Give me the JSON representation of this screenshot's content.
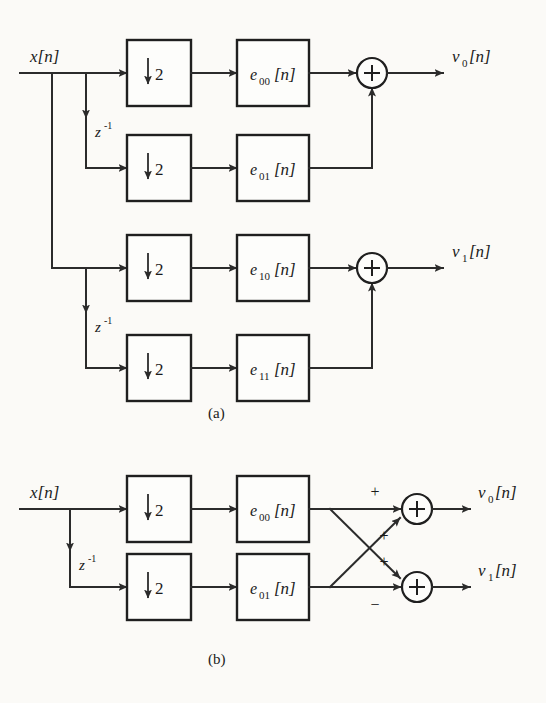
{
  "figure": {
    "background_color": "#fbfaf7",
    "ink_color": "#1f1f1f"
  },
  "panels": [
    {
      "id": "a",
      "caption": "(a)",
      "input_label": "x[n]",
      "delay_labels": [
        "z",
        "z"
      ],
      "delay_exponent": "-1",
      "branches": [
        {
          "downsampler": {
            "arrow": "↓",
            "factor": "2"
          },
          "filter_base": "e",
          "filter_sub": "00",
          "filter_bracket": "[n]",
          "adder_symbol": "+"
        },
        {
          "downsampler": {
            "arrow": "↓",
            "factor": "2"
          },
          "filter_base": "e",
          "filter_sub": "01",
          "filter_bracket": "[n]",
          "adder_symbol": "+"
        },
        {
          "downsampler": {
            "arrow": "↓",
            "factor": "2"
          },
          "filter_base": "e",
          "filter_sub": "10",
          "filter_bracket": "[n]",
          "adder_symbol": "+"
        },
        {
          "downsampler": {
            "arrow": "↓",
            "factor": "2"
          },
          "filter_base": "e",
          "filter_sub": "11",
          "filter_bracket": "[n]",
          "adder_symbol": "+"
        }
      ],
      "outputs": [
        {
          "base": "v",
          "sub": "0",
          "bracket": "[n]"
        },
        {
          "base": "v",
          "sub": "1",
          "bracket": "[n]"
        }
      ]
    },
    {
      "id": "b",
      "caption": "(b)",
      "input_label": "x[n]",
      "delay_labels": [
        "z"
      ],
      "delay_exponent": "-1",
      "branches": [
        {
          "downsampler": {
            "arrow": "↓",
            "factor": "2"
          },
          "filter_base": "e",
          "filter_sub": "00",
          "filter_bracket": "[n]"
        },
        {
          "downsampler": {
            "arrow": "↓",
            "factor": "2"
          },
          "filter_base": "e",
          "filter_sub": "01",
          "filter_bracket": "[n]"
        }
      ],
      "adders": [
        {
          "symbol": "+",
          "sign_top": "+",
          "sign_bottom": "+"
        },
        {
          "symbol": "+",
          "sign_top": "+",
          "sign_bottom": "−"
        }
      ],
      "outputs": [
        {
          "base": "v",
          "sub": "0",
          "bracket": "[n]"
        },
        {
          "base": "v",
          "sub": "1",
          "bracket": "[n]"
        }
      ]
    }
  ]
}
